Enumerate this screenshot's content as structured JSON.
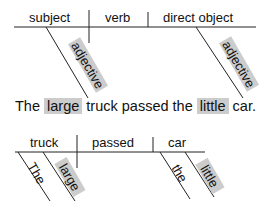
{
  "template": {
    "subject": "subject",
    "verb": "verb",
    "direct_object": "direct object",
    "modifier_left": "adjective",
    "modifier_right": "adjective"
  },
  "sentence": {
    "parts": [
      "The",
      "large",
      "truck passed the",
      "little",
      "car."
    ],
    "highlighted": [
      "large",
      "little"
    ],
    "highlight_color": "#cccccc"
  },
  "example": {
    "subject": "truck",
    "verb": "passed",
    "direct_object": "car",
    "subject_modifiers": [
      "The",
      "large"
    ],
    "object_modifiers": [
      "the",
      "little"
    ]
  }
}
